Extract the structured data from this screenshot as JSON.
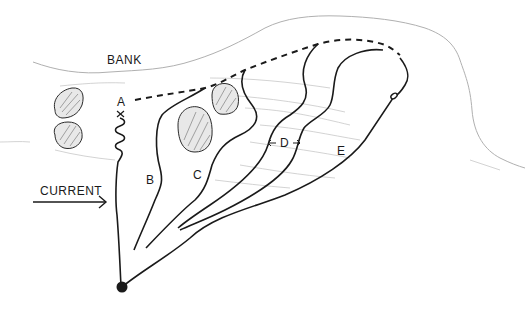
{
  "diagram": {
    "type": "hand-drawn fishing drift diagram",
    "labels": {
      "bank": "BANK",
      "current": "CURRENT",
      "a": "A",
      "b": "B",
      "c": "C",
      "d": "D",
      "e": "E"
    },
    "colors": {
      "ink": "#1a1a1a",
      "bank_line": "#b0b0b0",
      "water_lines": "#c8c8c8",
      "rock_fill": "#e6e6e6"
    },
    "elements": [
      {
        "id": "bank-line",
        "kind": "shoreline"
      },
      {
        "id": "rocks",
        "count": 4
      },
      {
        "id": "dashed-line",
        "kind": "casting path"
      },
      {
        "id": "drift-lines",
        "paths": [
          "A",
          "B",
          "C",
          "D",
          "E"
        ]
      },
      {
        "id": "rod-tip",
        "kind": "angler position dot"
      },
      {
        "id": "current-arrow",
        "direction": "right"
      }
    ]
  }
}
